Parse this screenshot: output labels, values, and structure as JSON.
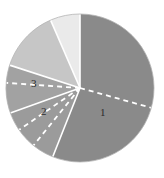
{
  "chart_data": {
    "type": "pie",
    "title": "",
    "subtitle": "",
    "legend_position": "none",
    "grid": false,
    "center": {
      "x": 80,
      "y": 88
    },
    "radius": 74,
    "start_angle_deg": -90,
    "direction": "clockwise",
    "background": "#ffffff",
    "categories": [
      "1",
      "2",
      "3",
      "4",
      "5"
    ],
    "values": [
      56,
      13.5,
      10.5,
      13.5,
      6.5
    ],
    "labels_shown": [
      "1",
      "2",
      "3"
    ],
    "slices": [
      {
        "name": "1",
        "label": "1",
        "label_shown": true,
        "value": 56,
        "start_deg": -90,
        "end_deg": 111.6,
        "color": "#8a8a8a",
        "label_x": 100,
        "label_y": 107
      },
      {
        "name": "2",
        "label": "2",
        "label_shown": true,
        "value": 13.5,
        "start_deg": 111.6,
        "end_deg": 160.2,
        "color": "#9b9b9b",
        "label_x": 41,
        "label_y": 106
      },
      {
        "name": "3",
        "label": "3",
        "label_shown": true,
        "value": 10.5,
        "start_deg": 160.2,
        "end_deg": 198.0,
        "color": "#a2a2a2",
        "label_x": 31,
        "label_y": 78
      },
      {
        "name": "4",
        "label": "",
        "label_shown": false,
        "value": 13.5,
        "start_deg": 198.0,
        "end_deg": 246.6,
        "color": "#c6c6c6",
        "label_x": null,
        "label_y": null
      },
      {
        "name": "5",
        "label": "",
        "label_shown": false,
        "value": 6.5,
        "start_deg": 246.6,
        "end_deg": 270.0,
        "color": "#eaeaea",
        "label_x": null,
        "label_y": null
      }
    ],
    "separator": {
      "color": "#ffffff",
      "width": 1.6
    },
    "dashed_radii": [
      {
        "name": "dashed-radius-right",
        "angle_deg": 15.5,
        "color": "#ffffff"
      },
      {
        "name": "dashed-radius-left",
        "angle_deg": 184.0,
        "color": "#ffffff"
      },
      {
        "name": "dashed-radius-lower-left-a",
        "angle_deg": 129.0,
        "color": "#ffffff"
      },
      {
        "name": "dashed-radius-lower-left-b",
        "angle_deg": 145.5,
        "color": "#ffffff"
      }
    ],
    "outline": {
      "color": "#b4b4b4",
      "width": 0.8
    }
  }
}
